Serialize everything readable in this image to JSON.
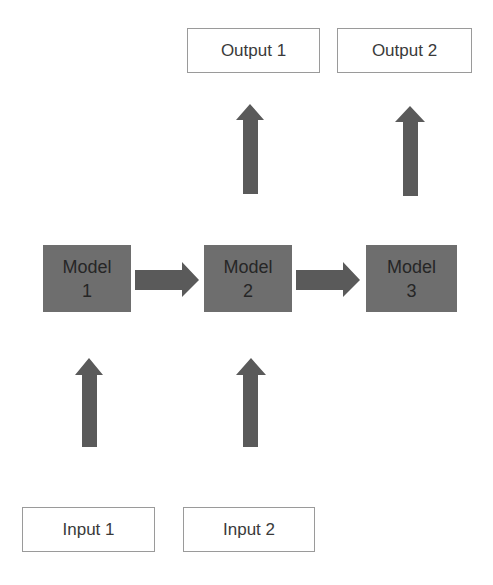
{
  "diagram": {
    "outputs": [
      {
        "label": "Output 1"
      },
      {
        "label": "Output 2"
      }
    ],
    "models": [
      {
        "line1": "Model",
        "line2": "1"
      },
      {
        "line1": "Model",
        "line2": "2"
      },
      {
        "line1": "Model",
        "line2": "3"
      }
    ],
    "inputs": [
      {
        "label": "Input 1"
      },
      {
        "label": "Input 2"
      }
    ],
    "colors": {
      "model_fill": "#6e6e6e",
      "arrow_fill": "#5a5a5a",
      "box_border": "#9a9a9a"
    }
  }
}
